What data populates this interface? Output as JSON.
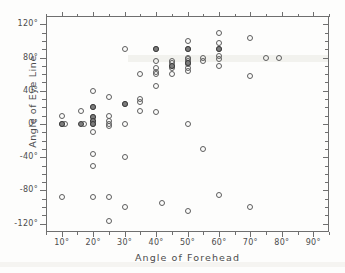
{
  "chart_data": {
    "type": "scatter",
    "title": "",
    "xlabel": "Angle  of  Forehead",
    "ylabel": "Angle of Eye Line",
    "xlim": [
      5,
      95
    ],
    "ylim": [
      -130,
      130
    ],
    "xticks": [
      "10°",
      "20°",
      "30°",
      "40°",
      "50°",
      "60°",
      "70°",
      "80°",
      "90°"
    ],
    "xtick_values": [
      10,
      20,
      30,
      40,
      50,
      60,
      70,
      80,
      90
    ],
    "yticks": [
      "120°",
      "80°",
      "40°",
      "0°",
      "-40°",
      "-80°",
      "-120°"
    ],
    "ytick_values": [
      120,
      80,
      40,
      0,
      -40,
      -80,
      -120
    ],
    "grid": false,
    "legend": "none",
    "marker_colors": {
      "open": "#5d5d5d",
      "filled": "#7d7d7d"
    },
    "series": [
      {
        "name": "open-markers",
        "marker": "open-circle",
        "points": [
          [
            10,
            10
          ],
          [
            10,
            0
          ],
          [
            11,
            0
          ],
          [
            10,
            -88
          ],
          [
            16,
            16
          ],
          [
            17,
            0
          ],
          [
            20,
            40
          ],
          [
            20,
            20
          ],
          [
            20,
            8
          ],
          [
            20,
            4
          ],
          [
            20,
            0
          ],
          [
            20,
            -10
          ],
          [
            20,
            -36
          ],
          [
            20,
            -50
          ],
          [
            20,
            -88
          ],
          [
            25,
            32
          ],
          [
            25,
            10
          ],
          [
            25,
            4
          ],
          [
            25,
            0
          ],
          [
            25,
            -2
          ],
          [
            25,
            -88
          ],
          [
            25,
            -117
          ],
          [
            30,
            90
          ],
          [
            30,
            24
          ],
          [
            30,
            0
          ],
          [
            30,
            -40
          ],
          [
            30,
            -100
          ],
          [
            35,
            60
          ],
          [
            35,
            30
          ],
          [
            35,
            26
          ],
          [
            35,
            16
          ],
          [
            40,
            90
          ],
          [
            40,
            76
          ],
          [
            40,
            68
          ],
          [
            40,
            62
          ],
          [
            40,
            60
          ],
          [
            40,
            46
          ],
          [
            40,
            14
          ],
          [
            42,
            -95
          ],
          [
            45,
            76
          ],
          [
            45,
            74
          ],
          [
            45,
            70
          ],
          [
            45,
            68
          ],
          [
            45,
            60
          ],
          [
            50,
            100
          ],
          [
            50,
            90
          ],
          [
            50,
            80
          ],
          [
            50,
            78
          ],
          [
            50,
            76
          ],
          [
            50,
            72
          ],
          [
            50,
            68
          ],
          [
            50,
            64
          ],
          [
            50,
            0
          ],
          [
            50,
            -105
          ],
          [
            55,
            80
          ],
          [
            55,
            76
          ],
          [
            55,
            -30
          ],
          [
            60,
            110
          ],
          [
            60,
            98
          ],
          [
            60,
            90
          ],
          [
            60,
            82
          ],
          [
            60,
            78
          ],
          [
            60,
            70
          ],
          [
            60,
            -86
          ],
          [
            70,
            104
          ],
          [
            70,
            58
          ],
          [
            70,
            -100
          ],
          [
            75,
            80
          ],
          [
            79,
            80
          ]
        ]
      },
      {
        "name": "filled-markers",
        "marker": "filled-circle",
        "points": [
          [
            10,
            0
          ],
          [
            16,
            0
          ],
          [
            20,
            20
          ],
          [
            20,
            8
          ],
          [
            20,
            4
          ],
          [
            20,
            0
          ],
          [
            30,
            24
          ],
          [
            40,
            90
          ],
          [
            45,
            70
          ],
          [
            50,
            90
          ],
          [
            50,
            74
          ],
          [
            60,
            90
          ]
        ]
      }
    ]
  }
}
